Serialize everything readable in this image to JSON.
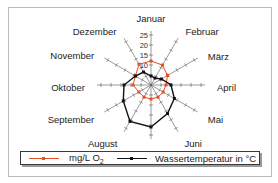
{
  "chart_data": {
    "type": "radar",
    "title": "",
    "categories": [
      "Januar",
      "Februar",
      "März",
      "April",
      "Mai",
      "Juni",
      "Juli",
      "August",
      "September",
      "Oktober",
      "November",
      "Dezember"
    ],
    "series": [
      {
        "name": "mg/L O2",
        "color": "#e0502a",
        "values": [
          12,
          11.5,
          9.5,
          7.5,
          7,
          7,
          7,
          7,
          7,
          9,
          9,
          12
        ]
      },
      {
        "name": "Wassertemperatur in °C",
        "color": "#111111",
        "values": [
          4.5,
          4,
          6,
          10,
          13.5,
          16.5,
          21,
          21,
          16,
          13.5,
          9,
          7.5
        ]
      }
    ],
    "radial_ticks": [
      "10",
      "15",
      "20",
      "25"
    ],
    "rlim": [
      0,
      26
    ],
    "grid": false,
    "legend_position": "bottom"
  },
  "legend": {
    "o2_label": "mg/L O",
    "o2_sub": "2",
    "temp_label": "Wassertemperatur  in °C"
  }
}
